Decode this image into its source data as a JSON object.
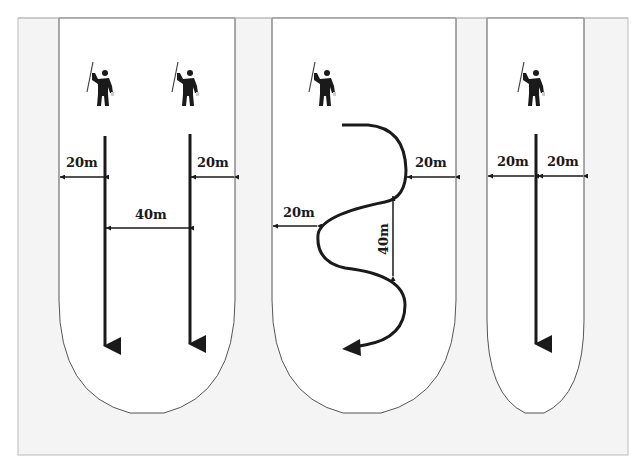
{
  "diagram": {
    "colors": {
      "frame_bg": "#f4f4f4",
      "lane_bg": "#ffffff",
      "line": "#1a1a1a",
      "border": "#555555"
    },
    "panels": [
      {
        "id": "parallel-two-searchers",
        "searchers": 2,
        "labels": {
          "left_margin": "20m",
          "right_margin": "20m",
          "spacing": "40m"
        }
      },
      {
        "id": "serpentine-single-searcher",
        "searchers": 1,
        "labels": {
          "right_margin": "20m",
          "left_margin": "20m",
          "loop_height": "40m"
        }
      },
      {
        "id": "single-line-searcher",
        "searchers": 1,
        "labels": {
          "left_margin": "20m",
          "right_margin": "20m"
        }
      }
    ]
  }
}
